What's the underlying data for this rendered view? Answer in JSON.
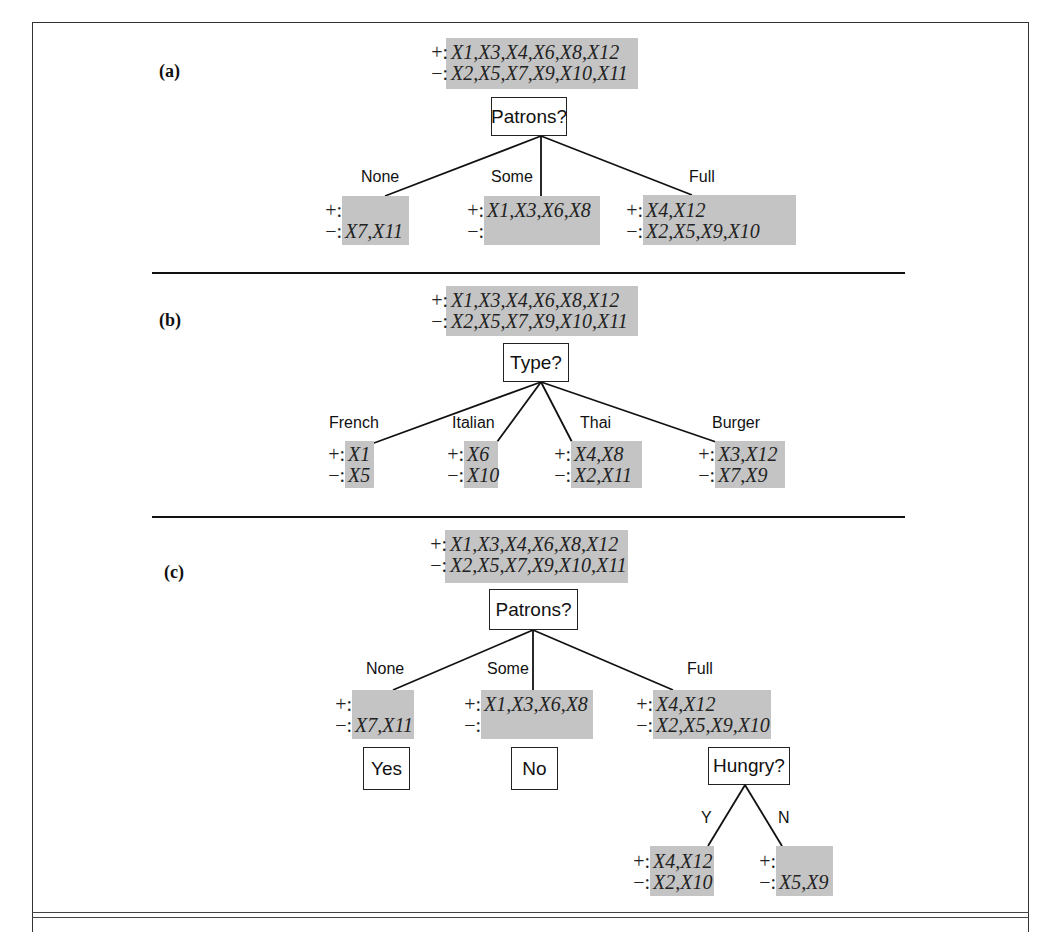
{
  "panels": [
    {
      "label": "(a)",
      "root": {
        "positive": "X1,X3,X4,X6,X8,X12",
        "negative": "X2,X5,X7,X9,X10,X11"
      },
      "attribute": "Patrons?",
      "branches": [
        {
          "value": "None",
          "positive": "",
          "negative": "X7,X11"
        },
        {
          "value": "Some",
          "positive": "X1,X3,X6,X8",
          "negative": ""
        },
        {
          "value": "Full",
          "positive": "X4,X12",
          "negative": "X2,X5,X9,X10"
        }
      ]
    },
    {
      "label": "(b)",
      "root": {
        "positive": "X1,X3,X4,X6,X8,X12",
        "negative": "X2,X5,X7,X9,X10,X11"
      },
      "attribute": "Type?",
      "branches": [
        {
          "value": "French",
          "positive": "X1",
          "negative": "X5"
        },
        {
          "value": "Italian",
          "positive": "X6",
          "negative": "X10"
        },
        {
          "value": "Thai",
          "positive": "X4,X8",
          "negative": "X2,X11"
        },
        {
          "value": "Burger",
          "positive": "X3,X12",
          "negative": "X7,X9"
        }
      ]
    },
    {
      "label": "(c)",
      "root": {
        "positive": "X1,X3,X4,X6,X8,X12",
        "negative": "X2,X5,X7,X9,X10,X11"
      },
      "attribute": "Patrons?",
      "branches": [
        {
          "value": "None",
          "positive": "",
          "negative": "X7,X11",
          "decision": "Yes"
        },
        {
          "value": "Some",
          "positive": "X1,X3,X6,X8",
          "negative": "",
          "decision": "No"
        },
        {
          "value": "Full",
          "positive": "X4,X12",
          "negative": "X2,X5,X9,X10",
          "decision": "Hungry?",
          "sub_branches": [
            {
              "value": "Y",
              "positive": "X4,X12",
              "negative": "X2,X10"
            },
            {
              "value": "N",
              "positive": "",
              "negative": "X5,X9"
            }
          ]
        }
      ]
    }
  ],
  "signs": {
    "positive": "+:",
    "negative": "−:"
  },
  "colors": {
    "set_fill": "#c4c4c4",
    "line": "#111111",
    "frame": "#333333"
  }
}
